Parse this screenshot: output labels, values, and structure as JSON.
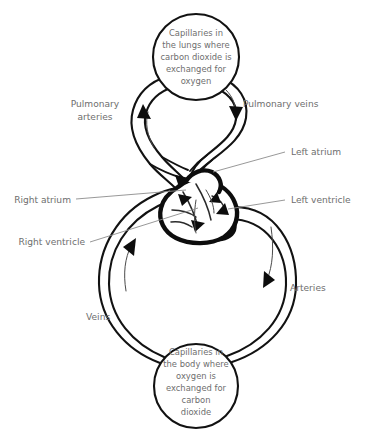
{
  "diagram": {
    "type": "biology-flow-diagram",
    "background_color": "#ffffff",
    "stroke_color": "#121212",
    "text_color": "#6e6e6e"
  },
  "organs": {
    "lungs": {
      "name": "lungs-capillaries",
      "lines": [
        "Capillaries in",
        "the lungs where",
        "carbon dioxide is",
        "exchanged for",
        "oxygen"
      ]
    },
    "body": {
      "name": "body-capillaries",
      "lines": [
        "Capillaries in",
        "the body where",
        "oxygen is",
        "exchanged for",
        "carbon",
        "dioxide"
      ]
    }
  },
  "labels": {
    "pulmonary_arteries": {
      "lines": [
        "Pulmonary",
        "arteries"
      ]
    },
    "pulmonary_veins": {
      "text": "Pulmonary veins"
    },
    "left_atrium": {
      "text": "Left atrium"
    },
    "left_ventricle": {
      "text": "Left ventricle"
    },
    "right_atrium": {
      "text": "Right atrium"
    },
    "right_ventricle": {
      "text": "Right ventricle"
    },
    "arteries": {
      "text": "Arteries"
    },
    "veins": {
      "text": "Veins"
    }
  },
  "flow": {
    "directions": [
      "pulmonary-artery-up-to-lungs",
      "pulmonary-vein-down-to-left-atrium",
      "aorta-down-to-body",
      "vena-cava-up-to-right-atrium"
    ]
  }
}
